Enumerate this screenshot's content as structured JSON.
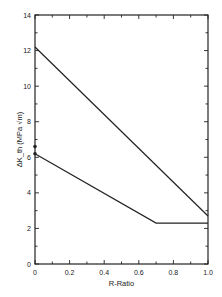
{
  "chart_data": {
    "type": "line",
    "title": "",
    "xlabel": "R-Ratio",
    "ylabel": "ΔK_th (MPa √m)",
    "xlim": [
      0,
      1.0
    ],
    "ylim": [
      0,
      14
    ],
    "grid": false,
    "legend": null,
    "x_ticks": [
      "0",
      "0.2",
      "0.4",
      "0.6",
      "0.8",
      "1.0"
    ],
    "y_ticks": [
      "0",
      "2",
      "4",
      "6",
      "8",
      "10",
      "12",
      "14"
    ],
    "series": [
      {
        "name": "upper",
        "x": [
          0,
          1.0
        ],
        "y": [
          12.2,
          2.7
        ]
      },
      {
        "name": "lower",
        "x": [
          0,
          0.7,
          1.0
        ],
        "y": [
          6.2,
          2.3,
          2.3
        ]
      }
    ],
    "points": [
      {
        "x": 0,
        "y": 6.6
      },
      {
        "x": 0,
        "y": 6.2
      }
    ]
  }
}
